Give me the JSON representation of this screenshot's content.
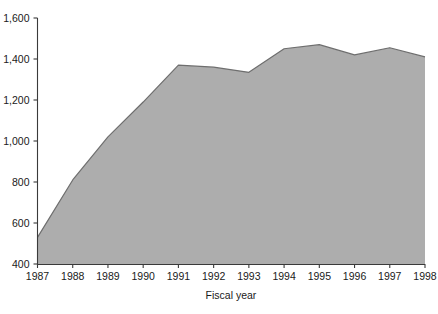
{
  "chart_data": {
    "type": "area",
    "title": "",
    "xlabel": "Fiscal year",
    "ylabel": "",
    "categories": [
      "1987",
      "1988",
      "1989",
      "1990",
      "1991",
      "1992",
      "1993",
      "1994",
      "1995",
      "1996",
      "1997",
      "1998"
    ],
    "x": [
      1987,
      1988,
      1989,
      1990,
      1991,
      1992,
      1993,
      1994,
      1995,
      1996,
      1997,
      1998
    ],
    "values": [
      530,
      810,
      1020,
      1190,
      1370,
      1360,
      1335,
      1450,
      1470,
      1420,
      1455,
      1410
    ],
    "xlim": [
      1987,
      1998
    ],
    "ylim": [
      400,
      1600
    ],
    "y_ticks": [
      400,
      600,
      800,
      1000,
      1200,
      1400,
      1600
    ],
    "y_tick_labels": [
      "400",
      "600",
      "800",
      "1,000",
      "1,200",
      "1,400",
      "1,600"
    ],
    "x_ticks": [
      1987,
      1988,
      1989,
      1990,
      1991,
      1992,
      1993,
      1994,
      1995,
      1996,
      1997,
      1998
    ],
    "x_tick_labels": [
      "1987",
      "1988",
      "1989",
      "1990",
      "1991",
      "1992",
      "1993",
      "1994",
      "1995",
      "1996",
      "1997",
      "1998"
    ],
    "grid": false,
    "legend": false,
    "legend_position": "none",
    "colors": {
      "area_fill": "#adadad",
      "area_line": "#6e6e6e",
      "axis": "#3a3a3a",
      "text": "#1a1a1a",
      "background": "#ffffff"
    }
  },
  "axes": {
    "x_title": "Fiscal year",
    "y_title": ""
  }
}
